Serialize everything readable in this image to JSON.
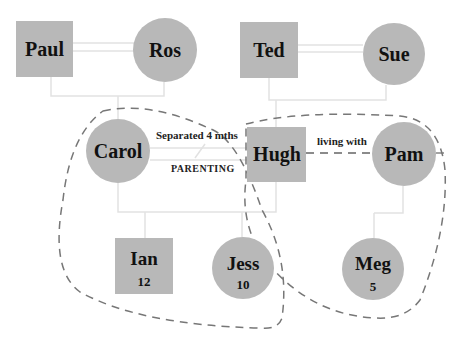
{
  "diagram": {
    "type": "genogram",
    "colors": {
      "node_fill": "#b8b8b8",
      "line": "#e2e2e2",
      "dashed_boundary": "#777777",
      "text": "#111111"
    },
    "people": [
      {
        "id": "paul",
        "name": "Paul",
        "sex": "male",
        "age": ""
      },
      {
        "id": "ros",
        "name": "Ros",
        "sex": "female",
        "age": ""
      },
      {
        "id": "ted",
        "name": "Ted",
        "sex": "male",
        "age": ""
      },
      {
        "id": "sue",
        "name": "Sue",
        "sex": "female",
        "age": ""
      },
      {
        "id": "carol",
        "name": "Carol",
        "sex": "female",
        "age": ""
      },
      {
        "id": "hugh",
        "name": "Hugh",
        "sex": "male",
        "age": ""
      },
      {
        "id": "pam",
        "name": "Pam",
        "sex": "female",
        "age": ""
      },
      {
        "id": "ian",
        "name": "Ian",
        "sex": "male",
        "age": "12"
      },
      {
        "id": "jess",
        "name": "Jess",
        "sex": "female",
        "age": "10"
      },
      {
        "id": "meg",
        "name": "Meg",
        "sex": "female",
        "age": "5"
      }
    ],
    "relationships": [
      {
        "from": "Paul",
        "to": "Ros",
        "type": "married"
      },
      {
        "from": "Ted",
        "to": "Sue",
        "type": "married"
      },
      {
        "from": "Carol",
        "to": "Hugh",
        "type": "separated",
        "label": "Separated 4 mths",
        "sublabel": "PARENTING"
      },
      {
        "from": "Hugh",
        "to": "Pam",
        "type": "cohabiting",
        "label": "living with"
      }
    ],
    "labels": {
      "separated": "Separated 4 mths",
      "parenting": "PARENTING",
      "living_with": "living with"
    },
    "households": [
      {
        "members": [
          "Carol",
          "Ian",
          "Jess"
        ],
        "style": "dashed"
      },
      {
        "members": [
          "Hugh",
          "Pam",
          "Meg"
        ],
        "style": "dashed"
      }
    ]
  }
}
